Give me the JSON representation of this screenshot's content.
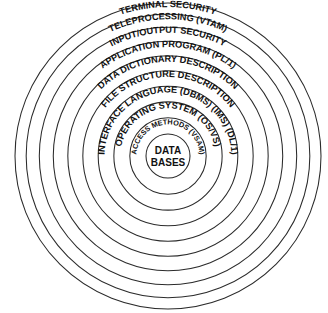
{
  "diagram": {
    "type": "concentric-rings",
    "title": "",
    "center": {
      "line1": "DATA",
      "line2": "BASES"
    },
    "rings": [
      {
        "index": 1,
        "label": "TERMINAL   SECURITY"
      },
      {
        "index": 2,
        "label": "TELEPROCESSING  (VTAM)"
      },
      {
        "index": 3,
        "label": "INPUT/OUTPUT  SECURITY"
      },
      {
        "index": 4,
        "label": "APPLICATION PROGRAM (PL/1)"
      },
      {
        "index": 5,
        "label": "DATA DICTIONARY DESCRIPTION"
      },
      {
        "index": 6,
        "label": "FILE STRUCTURE DESCRIPTION"
      },
      {
        "index": 7,
        "label": "INTERFACE LANGUAGE (DBMS) (IMS) (DL/1)"
      },
      {
        "index": 8,
        "label": "OPERATING SYSTEM (OS/VS)"
      },
      {
        "index": 9,
        "label": "ACCESS METHODS (VSAM)"
      }
    ],
    "colors": {
      "stroke": "#2b2b2b",
      "text": "#111111",
      "background": "#ffffff"
    }
  }
}
